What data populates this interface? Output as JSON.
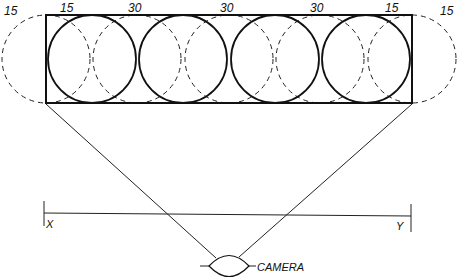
{
  "diagram": {
    "top_labels": [
      {
        "text": "15",
        "x": 4,
        "y": 14
      },
      {
        "text": "15",
        "x": 62,
        "y": 12
      },
      {
        "text": "30",
        "x": 130,
        "y": 12
      },
      {
        "text": "30",
        "x": 220,
        "y": 12
      },
      {
        "text": "30",
        "x": 312,
        "y": 12
      },
      {
        "text": "15",
        "x": 385,
        "y": 12
      },
      {
        "text": "15",
        "x": 440,
        "y": 14
      }
    ],
    "field_rectangle": {
      "x": 46,
      "y": 15,
      "width": 366,
      "height": 88
    },
    "solid_circles": [
      {
        "cx": 92,
        "cy": 59,
        "r": 44
      },
      {
        "cx": 183,
        "cy": 59,
        "r": 44
      },
      {
        "cx": 275,
        "cy": 59,
        "r": 44
      },
      {
        "cx": 366,
        "cy": 59,
        "r": 44
      }
    ],
    "dashed_circles": [
      {
        "cx": 46,
        "cy": 59,
        "r": 44
      },
      {
        "cx": 137,
        "cy": 59,
        "r": 44
      },
      {
        "cx": 229,
        "cy": 59,
        "r": 44
      },
      {
        "cx": 320,
        "cy": 59,
        "r": 44
      },
      {
        "cx": 412,
        "cy": 59,
        "r": 44
      }
    ],
    "scale_bar": {
      "left_label": "X",
      "right_label": "Y"
    },
    "camera": {
      "label": "CAMERA"
    }
  }
}
